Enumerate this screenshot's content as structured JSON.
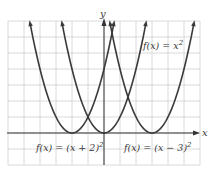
{
  "chart_data": {
    "type": "line",
    "title": "",
    "xlabel": "x",
    "ylabel": "y",
    "xlim": [
      -6,
      5.5
    ],
    "ylim": [
      -2,
      7
    ],
    "grid": true,
    "series": [
      {
        "name": "f(x) = x^2",
        "label_text": "f(x) = x",
        "label_sup": "2",
        "h": 0,
        "x": [
          -2.6,
          -2,
          -1,
          0,
          1,
          2,
          2.6
        ],
        "y": [
          6.76,
          4,
          1,
          0,
          1,
          4,
          6.76
        ]
      },
      {
        "name": "f(x) = (x + 2)^2",
        "label_text": "f(x) = (x + 2)",
        "label_sup": "2",
        "h": -2,
        "x": [
          -4.6,
          -4,
          -3,
          -2,
          -1,
          0,
          0.6
        ],
        "y": [
          6.76,
          4,
          1,
          0,
          1,
          4,
          6.76
        ]
      },
      {
        "name": "f(x) = (x - 3)^2",
        "label_text": "f(x) = (x − 3)",
        "label_sup": "2",
        "h": 3,
        "x": [
          0.4,
          1,
          2,
          3,
          4,
          5,
          5.6
        ],
        "y": [
          6.76,
          4,
          1,
          0,
          1,
          4,
          6.76
        ]
      }
    ]
  },
  "axes": {
    "x_label": "x",
    "y_label": "y"
  },
  "colors": {
    "curve": "#3a3a3a",
    "grid": "#d0d0d0",
    "axis": "#333333"
  }
}
